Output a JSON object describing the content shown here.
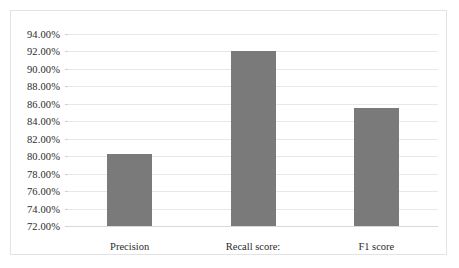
{
  "chart_data": {
    "type": "bar",
    "title": "",
    "subtitle": "",
    "xlabel": "",
    "ylabel": "",
    "categories": [
      "Precision",
      "Recall score:",
      "F1 score"
    ],
    "values": [
      80.2,
      92.0,
      85.5
    ],
    "value_labels": [
      "80.20%",
      "92.00%",
      "85.50%"
    ],
    "series": [
      {
        "name": "",
        "values": [
          80.2,
          92.0,
          85.5
        ],
        "color": "#7a7a7a"
      }
    ],
    "ylim": [
      72.0,
      94.0
    ],
    "ytick_values": [
      94.0,
      92.0,
      90.0,
      88.0,
      86.0,
      84.0,
      82.0,
      80.0,
      78.0,
      76.0,
      74.0,
      72.0
    ],
    "ytick_labels": [
      "94.00%",
      "92.00%",
      "90.00%",
      "88.00%",
      "86.00%",
      "84.00%",
      "82.00%",
      "80.00%",
      "78.00%",
      "76.00%",
      "74.00%",
      "72.00%"
    ],
    "grid": true,
    "grid_axis": "y",
    "legend": false,
    "legend_position": "none",
    "bar_color": "#7a7a7a",
    "gridline_color": "#e8e8e8",
    "border_color": "#e3e3e3",
    "text_color": "#2b2b2b",
    "background_color": "#ffffff",
    "annotations": []
  }
}
